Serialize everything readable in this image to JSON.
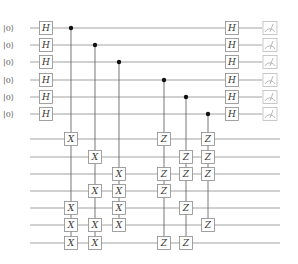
{
  "circuit": {
    "title": "",
    "input_state_label": "|0⟩",
    "top_register": {
      "rows_y": [
        28,
        45,
        62,
        80,
        97,
        114
      ],
      "initial_states": [
        "|0⟩",
        "|0⟩",
        "|0⟩",
        "|0⟩",
        "|0⟩",
        "|0⟩"
      ],
      "wire_start_x": 30,
      "wire_end_x": 262
    },
    "bottom_register": {
      "rows_y": [
        139,
        157,
        174,
        191,
        208,
        225,
        243
      ],
      "wire_start_x": 30,
      "wire_end_x": 280
    },
    "hadamard_columns": [
      {
        "x": 46,
        "label": "H"
      },
      {
        "x": 232,
        "label": "H"
      }
    ],
    "controlled_columns": [
      {
        "x": 71,
        "control_row": 0,
        "gate": "X",
        "targets": [
          0,
          4,
          5,
          6
        ]
      },
      {
        "x": 95,
        "control_row": 1,
        "gate": "X",
        "targets": [
          1,
          3,
          5,
          6
        ]
      },
      {
        "x": 119,
        "control_row": 2,
        "gate": "X",
        "targets": [
          2,
          3,
          4,
          5
        ]
      },
      {
        "x": 164,
        "control_row": 3,
        "gate": "Z",
        "targets": [
          0,
          2,
          3,
          6
        ]
      },
      {
        "x": 186,
        "control_row": 4,
        "gate": "Z",
        "targets": [
          1,
          2,
          4,
          6
        ]
      },
      {
        "x": 208,
        "control_row": 5,
        "gate": "Z",
        "targets": [
          0,
          1,
          2,
          5
        ]
      }
    ],
    "measurement": {
      "x": 270,
      "icon": "meter-icon",
      "count": 6
    },
    "gate_size": 13
  }
}
